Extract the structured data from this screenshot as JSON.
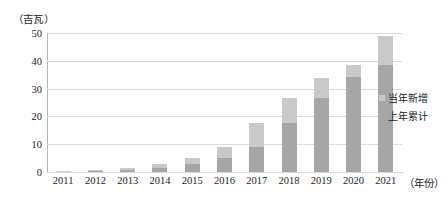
{
  "chart_data": {
    "type": "bar",
    "stacked": true,
    "title": "",
    "subtitle": "",
    "unit_caption": "（吉瓦）",
    "xlabel": "（年份）",
    "ylabel": "",
    "categories": [
      "2011",
      "2012",
      "2013",
      "2014",
      "2015",
      "2016",
      "2017",
      "2018",
      "2019",
      "2020",
      "2021"
    ],
    "ylim": [
      0,
      50
    ],
    "yticks": [
      0,
      10,
      20,
      30,
      40,
      50
    ],
    "ytick_labels": [
      "0",
      "10",
      "20",
      "30",
      "40",
      "50"
    ],
    "grid": true,
    "legend_position": "right",
    "series": [
      {
        "name": "上年累计",
        "color": "#a6a6a6",
        "values": [
          0.0,
          0.3,
          0.8,
          1.3,
          3.0,
          5.0,
          9.0,
          17.5,
          26.5,
          34.0,
          38.5
        ]
      },
      {
        "name": "当年新增",
        "color": "#c9c9c9",
        "values": [
          0.3,
          0.5,
          0.5,
          1.7,
          2.0,
          4.0,
          8.5,
          9.0,
          7.5,
          4.5,
          10.5
        ]
      }
    ],
    "totals": [
      0.3,
      0.8,
      1.3,
      3.0,
      5.0,
      9.0,
      17.5,
      26.5,
      34.0,
      38.5,
      49.0
    ]
  },
  "legend": {
    "items": [
      {
        "label": "当年新增",
        "color": "#c9c9c9"
      },
      {
        "label": "上年累计",
        "color": "#a6a6a6"
      }
    ]
  }
}
